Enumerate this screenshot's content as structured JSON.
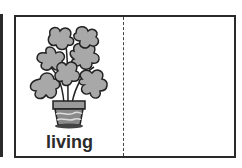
{
  "card": {
    "word": "living",
    "image": "potted-plant-icon",
    "colors": {
      "border": "#2a2a2a",
      "leaf": "#a8a8a8",
      "pot": "#8a8a8a"
    }
  }
}
